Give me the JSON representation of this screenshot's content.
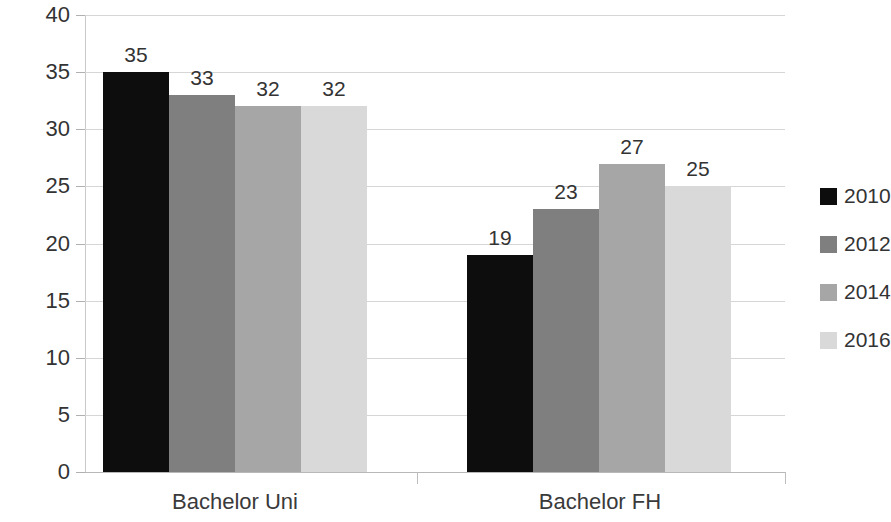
{
  "chart_data": {
    "type": "bar",
    "title": "",
    "subtitle": "",
    "xlabel": "",
    "ylabel": "",
    "categories": [
      "Bachelor Uni",
      "Bachelor FH"
    ],
    "series": [
      {
        "name": "2010",
        "color": "#0d0d0d",
        "values": [
          35,
          19
        ]
      },
      {
        "name": "2012",
        "color": "#7f7f7f",
        "values": [
          33,
          23
        ]
      },
      {
        "name": "2014",
        "color": "#a6a6a6",
        "values": [
          32,
          27
        ]
      },
      {
        "name": "2016",
        "color": "#d9d9d9",
        "values": [
          32,
          25
        ]
      }
    ],
    "ylim": [
      0,
      40
    ],
    "y_ticks": [
      0,
      5,
      10,
      15,
      20,
      25,
      30,
      35,
      40
    ],
    "y_tick_labels": [
      "0",
      "5",
      "10",
      "15",
      "20",
      "25",
      "30",
      "35",
      "40"
    ],
    "grid": true,
    "legend_position": "right",
    "data_labels": [
      {
        "group": "Bachelor Uni",
        "series": "2010",
        "value": "35"
      },
      {
        "group": "Bachelor Uni",
        "series": "2012",
        "value": "33"
      },
      {
        "group": "Bachelor Uni",
        "series": "2014",
        "value": "32"
      },
      {
        "group": "Bachelor Uni",
        "series": "2016",
        "value": "32"
      },
      {
        "group": "Bachelor FH",
        "series": "2010",
        "value": "19"
      },
      {
        "group": "Bachelor FH",
        "series": "2012",
        "value": "23"
      },
      {
        "group": "Bachelor FH",
        "series": "2014",
        "value": "27"
      },
      {
        "group": "Bachelor FH",
        "series": "2016",
        "value": "25"
      }
    ]
  },
  "legend": {
    "items": [
      {
        "label": "2010",
        "color": "#0d0d0d"
      },
      {
        "label": "2012",
        "color": "#7f7f7f"
      },
      {
        "label": "2014",
        "color": "#a6a6a6"
      },
      {
        "label": "2016",
        "color": "#d9d9d9"
      }
    ]
  },
  "axis": {
    "y_labels": [
      "40",
      "35",
      "30",
      "25",
      "20",
      "15",
      "10",
      "5",
      "0"
    ]
  },
  "colors": {
    "gridline": "#d6d6d6",
    "axis": "#bdbdbd",
    "text": "#333333",
    "background": "#ffffff"
  }
}
